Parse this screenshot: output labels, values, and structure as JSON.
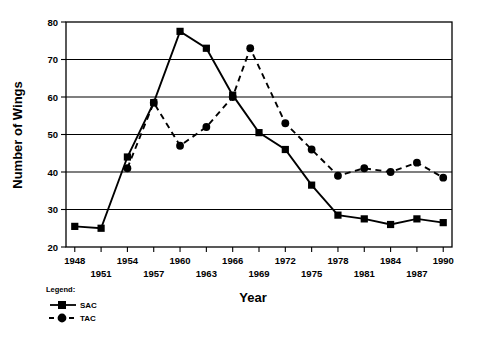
{
  "chart_data": {
    "type": "line",
    "title": "",
    "xlabel": "Year",
    "ylabel": "Number of Wings",
    "xlim": [
      1947,
      1991
    ],
    "ylim": [
      20,
      80
    ],
    "ytick_values": [
      20,
      30,
      40,
      50,
      60,
      70,
      80
    ],
    "ytick_labels": [
      "20",
      "30",
      "40",
      "50",
      "60",
      "70",
      "80"
    ],
    "xtick_values": [
      1948,
      1951,
      1954,
      1957,
      1960,
      1963,
      1966,
      1969,
      1972,
      1975,
      1978,
      1981,
      1984,
      1987,
      1990
    ],
    "xtick_labels": [
      "1948",
      "1951",
      "1954",
      "1957",
      "1960",
      "1963",
      "1966",
      "1969",
      "1972",
      "1975",
      "1978",
      "1981",
      "1984",
      "1987",
      "1990"
    ],
    "grid": "horizontal",
    "legend_position": "below-left",
    "legend_title": "Legend:",
    "series": [
      {
        "name": "SAC",
        "marker": "square",
        "linestyle": "solid",
        "color": "#000000",
        "x": [
          1948,
          1951,
          1954,
          1957,
          1960,
          1963,
          1966,
          1969,
          1972,
          1975,
          1978,
          1981,
          1984,
          1987,
          1990
        ],
        "values": [
          25.5,
          25.0,
          44.0,
          58.5,
          77.5,
          73.0,
          60.5,
          50.5,
          46.0,
          36.5,
          28.5,
          27.5,
          26.0,
          27.5,
          26.5
        ]
      },
      {
        "name": "TAC",
        "marker": "circle",
        "linestyle": "dashed",
        "color": "#000000",
        "x": [
          1954,
          1957,
          1960,
          1963,
          1966,
          1968,
          1972,
          1975,
          1978,
          1981,
          1984,
          1987,
          1990
        ],
        "values": [
          41.0,
          58.5,
          47.0,
          52.0,
          60.0,
          73.0,
          53.0,
          46.0,
          39.0,
          41.0,
          40.0,
          42.5,
          38.5
        ]
      }
    ]
  },
  "legend": {
    "title": "Legend:",
    "entries": [
      {
        "label": "SAC",
        "marker": "square",
        "linestyle": "solid"
      },
      {
        "label": "TAC",
        "marker": "circle",
        "linestyle": "dashed"
      }
    ]
  },
  "axes": {
    "x_title": "Year",
    "y_title": "Number of Wings"
  }
}
